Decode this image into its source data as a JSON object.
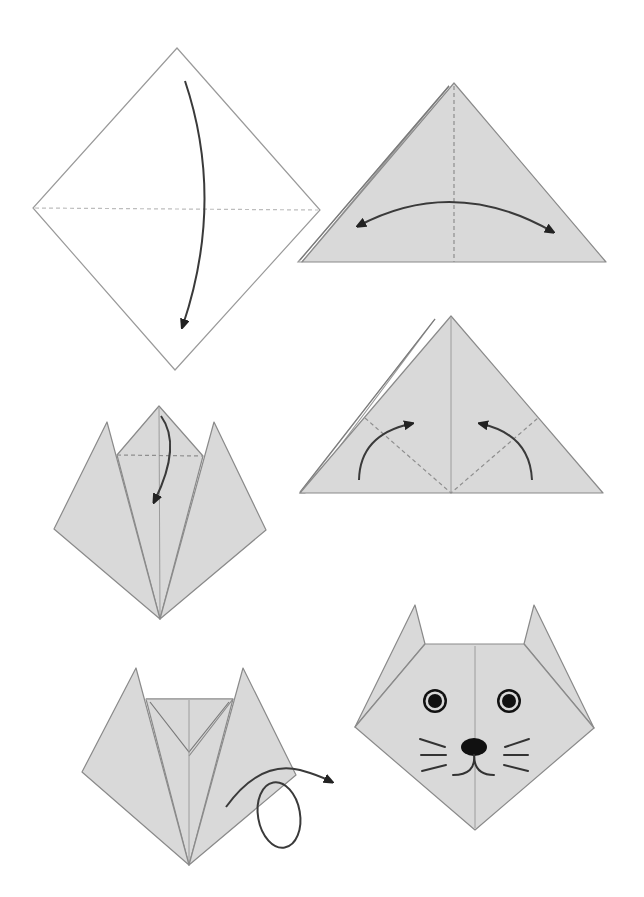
{
  "diagram": {
    "type": "step-by-step folding diagram",
    "colors": {
      "background": "#ffffff",
      "paper_fill": "#d9d9d9",
      "paper_edge": "#8a8a8a",
      "arrow": "#3a3a3a",
      "features": "#111111"
    },
    "steps": [
      {
        "index": 1,
        "shape": "square-diamond",
        "instruction_icon": "fold-down-arrow",
        "crease": "horizontal dashed diagonal"
      },
      {
        "index": 2,
        "shape": "triangle",
        "instruction_icon": "double-headed-arc-arrow",
        "crease": "vertical dashed center line"
      },
      {
        "index": 3,
        "shape": "triangle",
        "instruction_icon": "two-fold-up-arrows",
        "crease": "two dashed diagonal lines"
      },
      {
        "index": 4,
        "shape": "triangle-with-ears",
        "instruction_icon": "fold-down-arrow",
        "crease": "horizontal dashed line at top flap"
      },
      {
        "index": 5,
        "shape": "cat-head-folded",
        "instruction_icon": "turn-over-loop-arrow",
        "crease": "center line"
      },
      {
        "index": 6,
        "shape": "finished-cat-face",
        "features": [
          "eyes",
          "nose",
          "mouth",
          "whiskers"
        ]
      }
    ]
  }
}
